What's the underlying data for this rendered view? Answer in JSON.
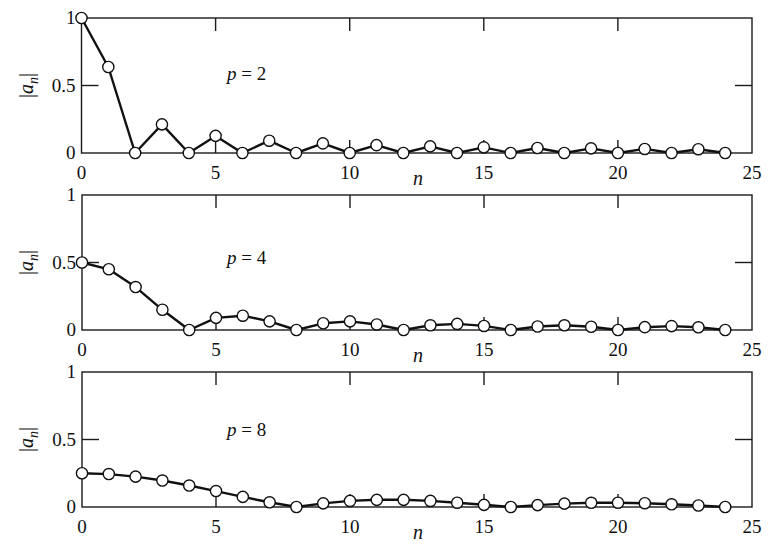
{
  "figure": {
    "background": "#ffffff",
    "line_color": "#111111",
    "marker_fill": "#ffffff"
  },
  "chart_data": [
    {
      "type": "line",
      "title": "",
      "annotation": "p = 2",
      "xlabel": "n",
      "ylabel": "|a_n|",
      "xlim": [
        0,
        25
      ],
      "ylim": [
        0,
        1
      ],
      "xticks": [
        0,
        5,
        10,
        15,
        20,
        25
      ],
      "xtick_labels": [
        "0",
        "5",
        "10",
        "15",
        "20",
        "25"
      ],
      "yticks": [
        0,
        0.5,
        1
      ],
      "ytick_labels": [
        "0",
        "0.5",
        "1"
      ],
      "grid": false,
      "marker": "open-circle",
      "x": [
        0,
        1,
        2,
        3,
        4,
        5,
        6,
        7,
        8,
        9,
        10,
        11,
        12,
        13,
        14,
        15,
        16,
        17,
        18,
        19,
        20,
        21,
        22,
        23,
        24
      ],
      "values": [
        1.0,
        0.637,
        0,
        0.212,
        0,
        0.127,
        0,
        0.091,
        0,
        0.071,
        0,
        0.058,
        0,
        0.049,
        0,
        0.042,
        0,
        0.037,
        0,
        0.034,
        0,
        0.03,
        0,
        0.028,
        0
      ]
    },
    {
      "type": "line",
      "title": "",
      "annotation": "p = 4",
      "xlabel": "n",
      "ylabel": "|a_n|",
      "xlim": [
        0,
        25
      ],
      "ylim": [
        0,
        1
      ],
      "xticks": [
        0,
        5,
        10,
        15,
        20,
        25
      ],
      "xtick_labels": [
        "0",
        "5",
        "10",
        "15",
        "20",
        "25"
      ],
      "yticks": [
        0,
        0.5,
        1
      ],
      "ytick_labels": [
        "0",
        "0.5",
        "1"
      ],
      "grid": false,
      "marker": "open-circle",
      "x": [
        0,
        1,
        2,
        3,
        4,
        5,
        6,
        7,
        8,
        9,
        10,
        11,
        12,
        13,
        14,
        15,
        16,
        17,
        18,
        19,
        20,
        21,
        22,
        23,
        24
      ],
      "values": [
        0.5,
        0.45,
        0.318,
        0.15,
        0,
        0.09,
        0.106,
        0.064,
        0,
        0.05,
        0.064,
        0.041,
        0,
        0.035,
        0.045,
        0.03,
        0,
        0.026,
        0.035,
        0.024,
        0,
        0.021,
        0.029,
        0.02,
        0
      ]
    },
    {
      "type": "line",
      "title": "",
      "annotation": "p = 8",
      "xlabel": "n",
      "ylabel": "|a_n|",
      "xlim": [
        0,
        25
      ],
      "ylim": [
        0,
        1
      ],
      "xticks": [
        0,
        5,
        10,
        15,
        20,
        25
      ],
      "xtick_labels": [
        "0",
        "5",
        "10",
        "15",
        "20",
        "25"
      ],
      "yticks": [
        0,
        0.5,
        1
      ],
      "ytick_labels": [
        "0",
        "0.5",
        "1"
      ],
      "grid": false,
      "marker": "open-circle",
      "x": [
        0,
        1,
        2,
        3,
        4,
        5,
        6,
        7,
        8,
        9,
        10,
        11,
        12,
        13,
        14,
        15,
        16,
        17,
        18,
        19,
        20,
        21,
        22,
        23,
        24
      ],
      "values": [
        0.25,
        0.244,
        0.225,
        0.196,
        0.159,
        0.118,
        0.075,
        0.035,
        0,
        0.027,
        0.045,
        0.053,
        0.053,
        0.045,
        0.032,
        0.016,
        0,
        0.014,
        0.025,
        0.031,
        0.032,
        0.028,
        0.02,
        0.011,
        0
      ]
    }
  ]
}
